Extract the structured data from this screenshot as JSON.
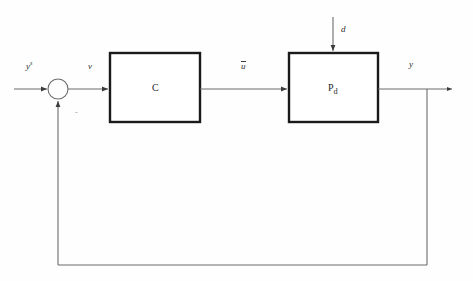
{
  "diagram": {
    "type": "control-block-diagram",
    "background_color": "#fefefe",
    "line_color": "#6b6b6b",
    "block_border_color": "#1a1a1a",
    "text_color": "#2e2e2e"
  },
  "blocks": [
    {
      "id": "controller",
      "label": "C",
      "x": 110,
      "y": 53,
      "width": 90,
      "height": 69
    },
    {
      "id": "plant",
      "label_base": "P",
      "label_sub": "d",
      "x": 289,
      "y": 53,
      "width": 89,
      "height": 69
    }
  ],
  "junction": {
    "id": "summing-junction",
    "cx": 58,
    "cy": 89,
    "r": 10,
    "feedback_sign": "-"
  },
  "signals": {
    "reference": {
      "base": "y",
      "sup": "s",
      "x": 26,
      "y": 66
    },
    "error": {
      "label": "v",
      "x": 88,
      "y": 66
    },
    "control": {
      "label": "u",
      "overbar": true,
      "x": 241,
      "y": 65
    },
    "disturbance": {
      "label": "d",
      "x": 341,
      "y": 29
    },
    "output": {
      "label": "y",
      "x": 409,
      "y": 64
    }
  },
  "geometry": {
    "signal_line_y": 89,
    "feedback_line_y": 265,
    "feedback_branch_x": 427,
    "input_start_x": 14,
    "output_end_x": 452,
    "disturbance_x": 333,
    "disturbance_start_y": 17
  }
}
